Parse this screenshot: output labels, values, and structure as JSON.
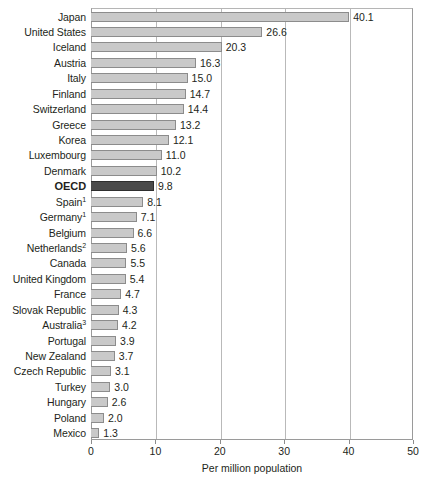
{
  "chart_data": {
    "type": "bar",
    "orientation": "horizontal",
    "title": "",
    "xlabel": "Per million population",
    "ylabel": "",
    "xlim": [
      0,
      50
    ],
    "xticks": [
      0,
      10,
      20,
      30,
      40,
      50
    ],
    "xtick_labels": [
      "0",
      "10",
      "20",
      "30",
      "40",
      "50"
    ],
    "grid": true,
    "grid_axis": "x",
    "legend": null,
    "highlight_category": "OECD",
    "bar_color": "#c9c9c9",
    "bar_edge_color": "#8c8c8c",
    "highlight_bar_color": "#4a4a4a",
    "categories": [
      "Japan",
      "United States",
      "Iceland",
      "Austria",
      "Italy",
      "Finland",
      "Switzerland",
      "Greece",
      "Korea",
      "Luxembourg",
      "Denmark",
      "OECD",
      "Spain",
      "Germany",
      "Belgium",
      "Netherlands",
      "Canada",
      "United Kingdom",
      "France",
      "Slovak Republic",
      "Australia",
      "Portugal",
      "New Zealand",
      "Czech Republic",
      "Turkey",
      "Hungary",
      "Poland",
      "Mexico"
    ],
    "values": [
      40.1,
      26.6,
      20.3,
      16.3,
      15.0,
      14.7,
      14.4,
      13.2,
      12.1,
      11.0,
      10.2,
      9.8,
      8.1,
      7.1,
      6.6,
      5.6,
      5.5,
      5.4,
      4.7,
      4.3,
      4.2,
      3.9,
      3.7,
      3.1,
      3.0,
      2.6,
      2.0,
      1.3
    ],
    "value_labels": [
      "40.1",
      "26.6",
      "20.3",
      "16.3",
      "15.0",
      "14.7",
      "14.4",
      "13.2",
      "12.1",
      "11.0",
      "10.2",
      "9.8",
      "8.1",
      "7.1",
      "6.6",
      "5.6",
      "5.5",
      "5.4",
      "4.7",
      "4.3",
      "4.2",
      "3.9",
      "3.7",
      "3.1",
      "3.0",
      "2.6",
      "2.0",
      "1.3"
    ],
    "footnote_markers": {
      "Spain": "1",
      "Germany": "1",
      "Netherlands": "2",
      "Australia": "3"
    }
  }
}
